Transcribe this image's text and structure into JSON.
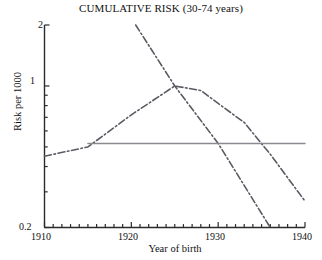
{
  "chart_data": {
    "type": "line",
    "title": "CUMULATIVE RISK (30-74 years)",
    "xlabel": "Year of birth",
    "ylabel": "Risk per 1000",
    "xlim": [
      1910,
      1940
    ],
    "ylim": [
      0.2,
      2
    ],
    "yscale": "log",
    "grid": false,
    "legend": null,
    "xticks": [
      1910,
      1920,
      1930,
      1940
    ],
    "xtick_labels": [
      "1910",
      "1920",
      "1930",
      "1940"
    ],
    "xtick_minor_step": 1,
    "yticks": [
      0.2,
      1,
      2
    ],
    "ytick_labels": [
      "0.2",
      "1",
      "2"
    ],
    "series": [
      {
        "name": "rise-and-fall-cohort-curve",
        "style": "dash-dot",
        "color": "#5a5a63",
        "x": [
          1910,
          1915,
          1920,
          1925,
          1928,
          1930,
          1933,
          1936,
          1940
        ],
        "y": [
          0.45,
          0.5,
          0.72,
          1.0,
          0.95,
          0.82,
          0.66,
          0.46,
          0.27
        ]
      },
      {
        "name": "steep-declining-cohort-curve",
        "style": "dash-dot",
        "color": "#5a5a63",
        "x": [
          1920.5,
          1925,
          1930,
          1936
        ],
        "y": [
          2.0,
          1.0,
          0.52,
          0.2
        ]
      },
      {
        "name": "flat-reference-line",
        "style": "solid",
        "color": "#8a8a90",
        "x": [
          1915,
          1940
        ],
        "y": [
          0.52,
          0.52
        ]
      }
    ]
  }
}
